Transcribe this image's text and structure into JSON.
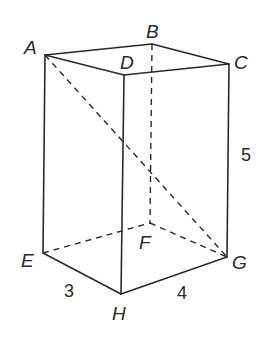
{
  "vertices": {
    "A": {
      "label": "A",
      "x": 45,
      "y": 55
    },
    "B": {
      "label": "B",
      "x": 152,
      "y": 44
    },
    "C": {
      "label": "C",
      "x": 229,
      "y": 64
    },
    "D": {
      "label": "D",
      "x": 124,
      "y": 75
    },
    "E": {
      "label": "E",
      "x": 43,
      "y": 253
    },
    "F": {
      "label": "F",
      "x": 150,
      "y": 223
    },
    "G": {
      "label": "G",
      "x": 227,
      "y": 257
    },
    "H": {
      "label": "H",
      "x": 121,
      "y": 294
    }
  },
  "dimensions": {
    "EH": "3",
    "HG": "4",
    "CG": "5"
  },
  "edges_solid": [
    "AB",
    "BC",
    "CD",
    "DA",
    "AE",
    "DH",
    "CG",
    "EH",
    "HG"
  ],
  "edges_hidden": [
    "BF",
    "EF",
    "FG",
    "AG"
  ],
  "colors": {
    "line": "#2a2a2a",
    "background": "#ffffff"
  }
}
